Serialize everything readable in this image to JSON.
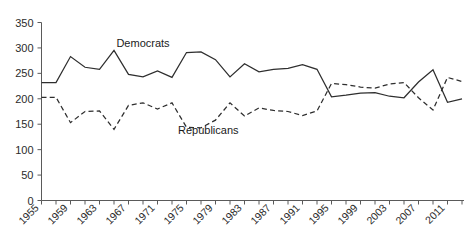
{
  "chart_data": {
    "type": "line",
    "title": "",
    "subtitle": "",
    "xlabel": "",
    "ylabel": "",
    "xlim": [
      1955,
      2013
    ],
    "ylim": [
      0,
      350
    ],
    "grid": false,
    "legend_position": "inline-annotation",
    "y_ticks": [
      0,
      50,
      100,
      150,
      200,
      250,
      300,
      350
    ],
    "y_tick_labels": [
      "0",
      "50",
      "100",
      "150",
      "200",
      "250",
      "300",
      "350"
    ],
    "x_tick_labels": [
      "1955",
      "1959",
      "1963",
      "1967",
      "1971",
      "1975",
      "1979",
      "1983",
      "1987",
      "1991",
      "1995",
      "1999",
      "2003",
      "2007",
      "2011"
    ],
    "x_tick_label_values": [
      1955,
      1959,
      1963,
      1967,
      1971,
      1975,
      1979,
      1983,
      1987,
      1991,
      1995,
      1999,
      2003,
      2007,
      2011
    ],
    "x_minor_ticks": [
      1955,
      1957,
      1959,
      1961,
      1963,
      1965,
      1967,
      1969,
      1971,
      1973,
      1975,
      1977,
      1979,
      1981,
      1983,
      1985,
      1987,
      1989,
      1991,
      1993,
      1995,
      1997,
      1999,
      2001,
      2003,
      2005,
      2007,
      2009,
      2011,
      2013
    ],
    "x": [
      1955,
      1957,
      1959,
      1961,
      1963,
      1965,
      1967,
      1969,
      1971,
      1973,
      1975,
      1977,
      1979,
      1981,
      1983,
      1985,
      1987,
      1989,
      1991,
      1993,
      1995,
      1997,
      1999,
      2001,
      2003,
      2005,
      2007,
      2009,
      2011,
      2013
    ],
    "series": [
      {
        "name": "Democrats",
        "style": "solid",
        "color": "#2e2e2e",
        "label_x": 1969,
        "label_y": 302,
        "values": [
          232,
          232,
          283,
          262,
          258,
          295,
          248,
          243,
          255,
          242,
          291,
          292,
          277,
          243,
          269,
          253,
          258,
          260,
          267,
          258,
          204,
          207,
          211,
          212,
          205,
          202,
          233,
          257,
          193,
          200
        ]
      },
      {
        "name": "Republicans",
        "style": "dashed",
        "color": "#2e2e2e",
        "label_x": 1978,
        "label_y": 131,
        "values": [
          203,
          203,
          153,
          175,
          176,
          140,
          187,
          192,
          180,
          192,
          144,
          143,
          158,
          192,
          166,
          182,
          177,
          175,
          167,
          176,
          230,
          228,
          223,
          221,
          229,
          232,
          202,
          178,
          242,
          234
        ]
      }
    ]
  }
}
